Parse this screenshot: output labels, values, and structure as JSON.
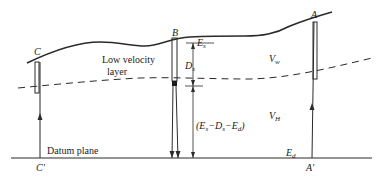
{
  "diagram": {
    "points": {
      "c": "C",
      "b": "B",
      "a": "A",
      "c_prime": "C′",
      "a_prime": "A′"
    },
    "layer_label_line1": "Low velocity",
    "layer_label_line2": "layer",
    "datum_label": "Datum plane",
    "symbols": {
      "es": "E",
      "es_sub": "s",
      "ds": "D",
      "ds_sub": "s",
      "vw": "V",
      "vw_sub": "w",
      "vh": "V",
      "vh_sub": "H",
      "ed": "E",
      "ed_sub": "d",
      "formula": "(E",
      "formula_s1": "s",
      "formula_mid1": "−D",
      "formula_s2": "s",
      "formula_mid2": "−E",
      "formula_s3": "d",
      "formula_end": ")"
    },
    "colors": {
      "line": "#2a2a2a",
      "background": "#ffffff"
    }
  }
}
